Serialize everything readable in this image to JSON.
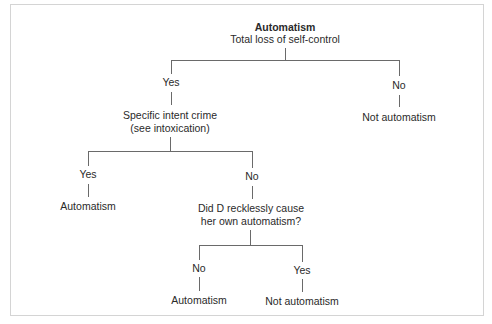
{
  "diagram": {
    "title": "Automatism",
    "root_question": "Total loss of self-control",
    "branches": {
      "root_yes": "Yes",
      "root_no": "No",
      "root_no_outcome": "Not automatism",
      "q2_line1": "Specific intent crime",
      "q2_line2": "(see intoxication)",
      "q2_yes": "Yes",
      "q2_yes_outcome": "Automatism",
      "q2_no": "No",
      "q3_line1": "Did D recklessly cause",
      "q3_line2": "her own automatism?",
      "q3_no": "No",
      "q3_no_outcome": "Automatism",
      "q3_yes": "Yes",
      "q3_yes_outcome": "Not automatism"
    },
    "colors": {
      "line": "#6a6a6a",
      "text": "#2a2a2a",
      "border": "#d4d4d4"
    }
  }
}
